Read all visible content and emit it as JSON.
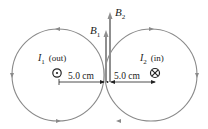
{
  "figure": {
    "type": "magnetic-field-diagram",
    "wire1": {
      "symbol": "I",
      "subscript": "1",
      "direction_label": "(out)",
      "direction_icon": "dot-out-of-page-icon"
    },
    "wire2": {
      "symbol": "I",
      "subscript": "2",
      "direction_label": "(in)",
      "direction_icon": "cross-into-page-icon"
    },
    "vectors": [
      {
        "symbol": "B",
        "subscript": "1",
        "relative_length": "shorter"
      },
      {
        "symbol": "B",
        "subscript": "2",
        "relative_length": "longer"
      }
    ],
    "distances": {
      "left": "5.0 cm",
      "right": "5.0 cm"
    },
    "field_line_color": "#8a8a8a",
    "vector_color": "#8f8f8f",
    "text_color": "#222222"
  }
}
